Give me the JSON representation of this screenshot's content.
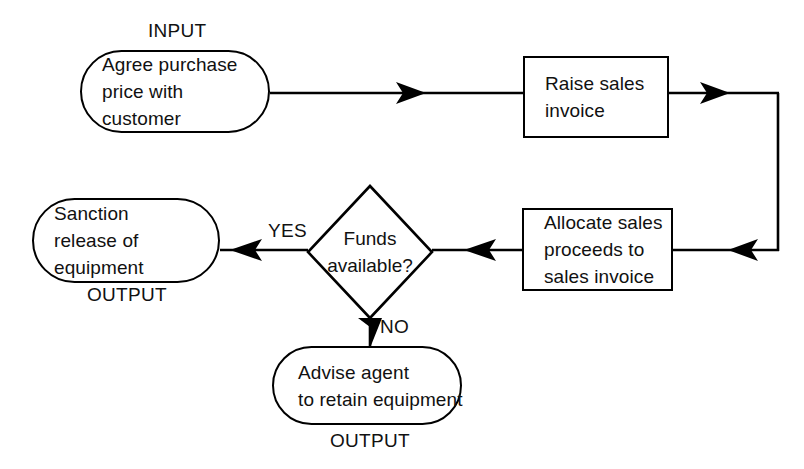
{
  "diagram": {
    "stroke_color": "#000000",
    "background_color": "#ffffff",
    "text_color": "#111111"
  },
  "nodes": {
    "input_agree": {
      "shape": "terminator",
      "io_label": "INPUT",
      "lines": [
        "Agree purchase",
        "price with",
        "customer"
      ]
    },
    "raise_invoice": {
      "shape": "process",
      "lines": [
        "Raise sales",
        "invoice"
      ]
    },
    "allocate_proceeds": {
      "shape": "process",
      "lines": [
        "Allocate sales",
        "proceeds to",
        "sales invoice"
      ]
    },
    "funds_available": {
      "shape": "decision",
      "lines": [
        "Funds",
        "available?"
      ]
    },
    "sanction_release": {
      "shape": "terminator",
      "io_label": "OUTPUT",
      "lines": [
        "Sanction",
        "release of",
        "equipment"
      ]
    },
    "advise_agent": {
      "shape": "terminator",
      "io_label": "OUTPUT",
      "lines": [
        "Advise agent",
        "to retain equipment"
      ]
    }
  },
  "edges": {
    "input_to_raise": {
      "label": ""
    },
    "raise_to_down": {
      "label": ""
    },
    "down_to_allocate": {
      "label": ""
    },
    "allocate_to_decision": {
      "label": ""
    },
    "decision_to_sanction": {
      "label": "YES"
    },
    "decision_to_advise": {
      "label": "NO"
    }
  }
}
